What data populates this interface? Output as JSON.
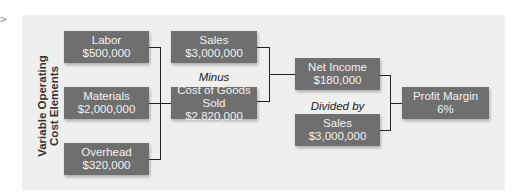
{
  "diagram": {
    "side_label": [
      "Variable Operating",
      "Cost Elements"
    ],
    "cost_elements": [
      {
        "title": "Labor",
        "value": "$500,000"
      },
      {
        "title": "Materials",
        "value": "$2,000,000"
      },
      {
        "title": "Overhead",
        "value": "$320,000"
      }
    ],
    "sales_top": {
      "title": "Sales",
      "value": "$3,000,000"
    },
    "op_minus": "Minus",
    "cogs": {
      "title": "Cost of Goods Sold",
      "value": "$2,820,000"
    },
    "net_income": {
      "title": "Net Income",
      "value": "$180,000"
    },
    "op_divided": "Divided by",
    "sales_bottom": {
      "title": "Sales",
      "value": "$3,000,000"
    },
    "profit_margin": {
      "title": "Profit Margin",
      "value": "6%"
    },
    "colors": {
      "box": "#6f6f6f",
      "box_text": "#f2f2f2",
      "panel": "#efefef",
      "line": "#222222"
    }
  }
}
